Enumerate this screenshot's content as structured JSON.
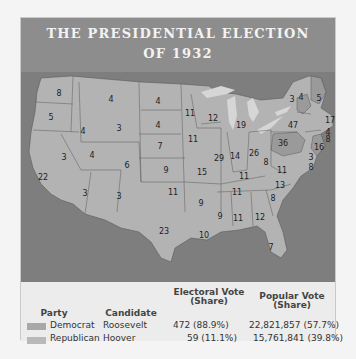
{
  "title": {
    "line1": "THE PRESIDENTIAL ELECTION",
    "line2": "OF 1932"
  },
  "map": {
    "colors": {
      "democrat": "#b3b3b3",
      "republican": "#9a9a9a",
      "water": "#7e7e7e",
      "lakes": "#d6d6d6",
      "border": "#5a5a5a"
    },
    "state_votes": [
      {
        "state": "WA",
        "votes": "8",
        "x": 38,
        "y": 21
      },
      {
        "state": "OR",
        "votes": "5",
        "x": 30,
        "y": 45
      },
      {
        "state": "CA",
        "votes": "22",
        "x": 22,
        "y": 105
      },
      {
        "state": "NV",
        "votes": "3",
        "x": 43,
        "y": 85
      },
      {
        "state": "ID",
        "votes": "4",
        "x": 62,
        "y": 59
      },
      {
        "state": "MT",
        "votes": "4",
        "x": 90,
        "y": 27
      },
      {
        "state": "WY",
        "votes": "3",
        "x": 98,
        "y": 56
      },
      {
        "state": "UT",
        "votes": "4",
        "x": 71,
        "y": 83
      },
      {
        "state": "AZ",
        "votes": "3",
        "x": 64,
        "y": 121
      },
      {
        "state": "CO",
        "votes": "6",
        "x": 106,
        "y": 93
      },
      {
        "state": "NM",
        "votes": "3",
        "x": 98,
        "y": 124
      },
      {
        "state": "ND",
        "votes": "4",
        "x": 137,
        "y": 29
      },
      {
        "state": "SD",
        "votes": "4",
        "x": 137,
        "y": 53
      },
      {
        "state": "NE",
        "votes": "7",
        "x": 139,
        "y": 74
      },
      {
        "state": "KS",
        "votes": "9",
        "x": 145,
        "y": 98
      },
      {
        "state": "OK",
        "votes": "11",
        "x": 152,
        "y": 120
      },
      {
        "state": "TX",
        "votes": "23",
        "x": 143,
        "y": 159
      },
      {
        "state": "MN",
        "votes": "11",
        "x": 169,
        "y": 41
      },
      {
        "state": "IA",
        "votes": "11",
        "x": 172,
        "y": 67
      },
      {
        "state": "MO",
        "votes": "15",
        "x": 181,
        "y": 100
      },
      {
        "state": "AR",
        "votes": "9",
        "x": 180,
        "y": 131
      },
      {
        "state": "LA",
        "votes": "10",
        "x": 183,
        "y": 163
      },
      {
        "state": "WI",
        "votes": "12",
        "x": 192,
        "y": 46
      },
      {
        "state": "IL",
        "votes": "29",
        "x": 198,
        "y": 86
      },
      {
        "state": "MI",
        "votes": "19",
        "x": 220,
        "y": 53
      },
      {
        "state": "IN",
        "votes": "14",
        "x": 214,
        "y": 84
      },
      {
        "state": "OH",
        "votes": "26",
        "x": 233,
        "y": 81
      },
      {
        "state": "KY",
        "votes": "11",
        "x": 223,
        "y": 104
      },
      {
        "state": "TN",
        "votes": "11",
        "x": 216,
        "y": 120
      },
      {
        "state": "MS",
        "votes": "9",
        "x": 199,
        "y": 144
      },
      {
        "state": "AL",
        "votes": "11",
        "x": 217,
        "y": 146
      },
      {
        "state": "GA",
        "votes": "12",
        "x": 239,
        "y": 145
      },
      {
        "state": "FL",
        "votes": "7",
        "x": 250,
        "y": 175
      },
      {
        "state": "SC",
        "votes": "8",
        "x": 252,
        "y": 126
      },
      {
        "state": "NC",
        "votes": "13",
        "x": 259,
        "y": 113
      },
      {
        "state": "VA",
        "votes": "11",
        "x": 261,
        "y": 98
      },
      {
        "state": "WV",
        "votes": "8",
        "x": 245,
        "y": 90
      },
      {
        "state": "PA",
        "votes": "36",
        "x": 262,
        "y": 71
      },
      {
        "state": "NY",
        "votes": "47",
        "x": 272,
        "y": 53
      },
      {
        "state": "VT",
        "votes": "3",
        "x": 271,
        "y": 27
      },
      {
        "state": "NH",
        "votes": "4",
        "x": 280,
        "y": 25
      },
      {
        "state": "ME",
        "votes": "5",
        "x": 298,
        "y": 26
      },
      {
        "state": "MA",
        "votes": "17",
        "x": 309,
        "y": 48
      },
      {
        "state": "RI",
        "votes": "4",
        "x": 307,
        "y": 60
      },
      {
        "state": "CT",
        "votes": "8",
        "x": 307,
        "y": 67
      },
      {
        "state": "NJ",
        "votes": "16",
        "x": 298,
        "y": 75
      },
      {
        "state": "DE",
        "votes": "3",
        "x": 290,
        "y": 85
      },
      {
        "state": "MD",
        "votes": "8",
        "x": 290,
        "y": 95
      }
    ]
  },
  "legend": {
    "headers": {
      "party": "Party",
      "candidate": "Candidate",
      "electoral_line1": "Electoral Vote",
      "electoral_line2": "(Share)",
      "popular_line1": "Popular Vote",
      "popular_line2": "(Share)"
    },
    "rows": [
      {
        "party": "Democrat",
        "candidate": "Roosevelt",
        "electoral": "472 (88.9%)",
        "popular": "22,821,857 (57.7%)",
        "color": "#a8a8a8"
      },
      {
        "party": "Republican",
        "candidate": "Hoover",
        "electoral": "59 (11.1%)",
        "popular": "15,761,841 (39.8%)",
        "color": "#b9b9b9"
      }
    ]
  }
}
